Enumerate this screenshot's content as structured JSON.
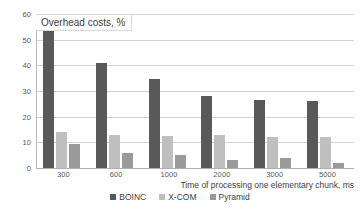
{
  "chart_data": {
    "type": "bar",
    "title": "Overhead costs, %",
    "xlabel": "Time of processing one elementary chunk, ms",
    "ylabel": "",
    "ylim": [
      0,
      60
    ],
    "ytick_step": 10,
    "grid": true,
    "legend_position": "bottom-center",
    "categories": [
      "300",
      "600",
      "1000",
      "2000",
      "3000",
      "5000"
    ],
    "ytick_labels": [
      "0",
      "10",
      "20",
      "30",
      "40",
      "50",
      "60"
    ],
    "series": [
      {
        "name": "BOINC",
        "color": "#595959",
        "values": [
          54.5,
          41,
          34.5,
          28,
          26.5,
          26
        ]
      },
      {
        "name": "X-COM",
        "color": "#bfbfbf",
        "values": [
          14,
          13,
          12.5,
          13,
          12,
          12
        ]
      },
      {
        "name": "Pyramid",
        "color": "#9a9a9a",
        "values": [
          9.4,
          6,
          5,
          3,
          4,
          2
        ]
      }
    ]
  }
}
